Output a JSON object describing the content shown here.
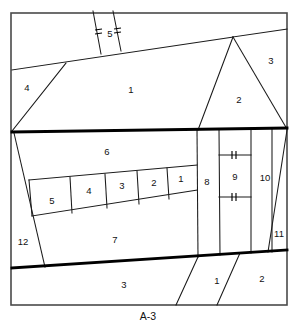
{
  "sheet": {
    "label": "A-3",
    "label_x": 148,
    "label_y": 317
  },
  "canvas": {
    "width": 296,
    "height": 331,
    "background": "#ffffff"
  },
  "colors": {
    "frame_stroke": "#4a4a4a",
    "thin_stroke": "#1a1a1a",
    "thick_stroke": "#000000",
    "text": "#111111",
    "background": "#ffffff"
  },
  "frame": {
    "x": 11,
    "y": 13,
    "width": 276,
    "height": 292
  },
  "room_labels": [
    {
      "text": "5",
      "x": 110,
      "y": 34,
      "name": "room-label-5-top"
    },
    {
      "text": "4",
      "x": 27,
      "y": 88,
      "name": "room-label-4"
    },
    {
      "text": "1",
      "x": 131,
      "y": 90,
      "name": "room-label-1-upper"
    },
    {
      "text": "3",
      "x": 271,
      "y": 61,
      "name": "room-label-3-upper-right"
    },
    {
      "text": "2",
      "x": 239,
      "y": 100,
      "name": "room-label-2-triangle"
    },
    {
      "text": "6",
      "x": 107,
      "y": 152,
      "name": "room-label-6"
    },
    {
      "text": "5",
      "x": 52,
      "y": 201,
      "name": "room-label-5-row"
    },
    {
      "text": "4",
      "x": 89,
      "y": 191,
      "name": "room-label-4-row"
    },
    {
      "text": "3",
      "x": 122,
      "y": 186,
      "name": "room-label-3-row"
    },
    {
      "text": "2",
      "x": 154,
      "y": 183,
      "name": "room-label-2-row"
    },
    {
      "text": "1",
      "x": 181,
      "y": 179,
      "name": "room-label-1-row"
    },
    {
      "text": "8",
      "x": 207,
      "y": 182,
      "name": "room-label-8"
    },
    {
      "text": "9",
      "x": 235,
      "y": 177,
      "name": "room-label-9"
    },
    {
      "text": "10",
      "x": 265,
      "y": 178,
      "name": "room-label-10"
    },
    {
      "text": "7",
      "x": 115,
      "y": 240,
      "name": "room-label-7"
    },
    {
      "text": "12",
      "x": 23,
      "y": 242,
      "name": "room-label-12"
    },
    {
      "text": "11",
      "x": 279,
      "y": 234,
      "name": "room-label-11"
    },
    {
      "text": "3",
      "x": 124,
      "y": 285,
      "name": "room-label-3-bottom"
    },
    {
      "text": "1",
      "x": 217,
      "y": 281,
      "name": "room-label-1-bottom"
    },
    {
      "text": "2",
      "x": 262,
      "y": 279,
      "name": "room-label-2-bottom"
    }
  ],
  "structure": {
    "thick_walls": [
      {
        "name": "wall-upper-main",
        "d": "M 12 132 L 287 128"
      },
      {
        "name": "wall-lower-main",
        "d": "M 12 268 L 287 250"
      }
    ],
    "thin_walls": [
      {
        "name": "roof-ridge-left",
        "d": "M 12 70 L 233 37"
      },
      {
        "name": "roof-ridge-right",
        "d": "M 233 37 L 287 29"
      },
      {
        "name": "diagonal-room4",
        "d": "M 12 131 L 66 63"
      },
      {
        "name": "corridor-left",
        "d": "M 93 11 L 101 54"
      },
      {
        "name": "corridor-right",
        "d": "M 113 11 L 121 51"
      },
      {
        "name": "triangle-left",
        "d": "M 233 37 L 198 130"
      },
      {
        "name": "triangle-right",
        "d": "M 233 37 L 287 129"
      },
      {
        "name": "vert-8-left",
        "d": "M 197 129 L 198 257"
      },
      {
        "name": "vert-8-right",
        "d": "M 219 129 L 220 255"
      },
      {
        "name": "vert-9-right",
        "d": "M 251 128 L 251 253"
      },
      {
        "name": "vert-10-right",
        "d": "M 272 128 L 272 252"
      },
      {
        "name": "door-band-upper",
        "d": "M 219 155 L 251 155"
      },
      {
        "name": "door-band-lower",
        "d": "M 219 197 L 251 197"
      },
      {
        "name": "region12-diagonal",
        "d": "M 14 133 L 45 267"
      },
      {
        "name": "row-top-edge",
        "d": "M 29 180 L 197 165"
      },
      {
        "name": "row-bottom-edge",
        "d": "M 32 216 L 197 190"
      },
      {
        "name": "row-div-5-4",
        "d": "M 70 177 L 72 213"
      },
      {
        "name": "row-div-4-3",
        "d": "M 105 174 L 107 208"
      },
      {
        "name": "row-div-3-2",
        "d": "M 137 171 L 139 204"
      },
      {
        "name": "row-div-2-1",
        "d": "M 167 168 L 169 199"
      },
      {
        "name": "row-left-cap",
        "d": "M 29 180 L 32 216"
      },
      {
        "name": "region11-diagonal",
        "d": "M 287 130 L 268 252"
      },
      {
        "name": "bottom-div-1",
        "d": "M 198 257 L 176 305"
      },
      {
        "name": "bottom-div-2",
        "d": "M 240 253 L 217 305"
      }
    ],
    "door_ticks": [
      {
        "name": "tick-corridor-left-a",
        "d": "M 95 30 L 102 29"
      },
      {
        "name": "tick-corridor-left-b",
        "d": "M 95 34 L 102 33"
      },
      {
        "name": "tick-corridor-right-a",
        "d": "M 114 29 L 121 28"
      },
      {
        "name": "tick-corridor-right-b",
        "d": "M 114 33 L 121 32"
      },
      {
        "name": "tick-room9-upper-a",
        "d": "M 232 151 L 232 159"
      },
      {
        "name": "tick-room9-upper-b",
        "d": "M 236 151 L 236 159"
      },
      {
        "name": "tick-room9-lower-a",
        "d": "M 232 193 L 232 201"
      },
      {
        "name": "tick-room9-lower-b",
        "d": "M 236 193 L 236 201"
      }
    ]
  }
}
